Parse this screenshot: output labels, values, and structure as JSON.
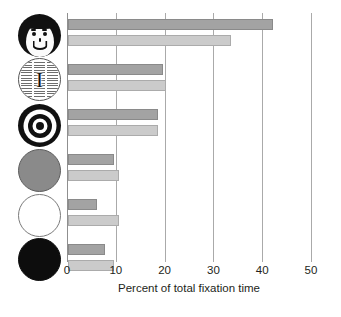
{
  "chart_data": {
    "type": "bar",
    "orientation": "horizontal",
    "title": "",
    "xlabel": "Percent of total fixation time",
    "ylabel": "",
    "xlim": [
      0,
      50
    ],
    "xticks": [
      0,
      10,
      20,
      30,
      40,
      50
    ],
    "xtick_labels": [
      "0",
      "10",
      "20",
      "30",
      "40",
      "50"
    ],
    "grid": "vertical gridlines at each x tick",
    "legend": "none shown",
    "categories": [
      "face",
      "newsprint",
      "bullseye",
      "gray-disc",
      "white-disc",
      "black-disc"
    ],
    "series": [
      {
        "name": "dark-gray-bar",
        "color": "#a3a3a3",
        "values": [
          42,
          19.5,
          18.5,
          9.5,
          6,
          7.5
        ]
      },
      {
        "name": "light-gray-bar",
        "color": "#cbcbcb",
        "values": [
          33.5,
          20,
          18.5,
          10.5,
          10.5,
          9.5
        ]
      }
    ]
  },
  "icons": [
    {
      "name": "smiling-face-icon",
      "letter": ""
    },
    {
      "name": "newsprint-text-icon",
      "letter": "I"
    },
    {
      "name": "bullseye-target-icon",
      "letter": ""
    },
    {
      "name": "gray-disc-icon",
      "letter": ""
    },
    {
      "name": "white-disc-icon",
      "letter": ""
    },
    {
      "name": "black-disc-icon",
      "letter": ""
    }
  ],
  "axis": {
    "xlabel": "Percent of total fixation time",
    "ticks": [
      "0",
      "10",
      "20",
      "30",
      "40",
      "50"
    ]
  }
}
